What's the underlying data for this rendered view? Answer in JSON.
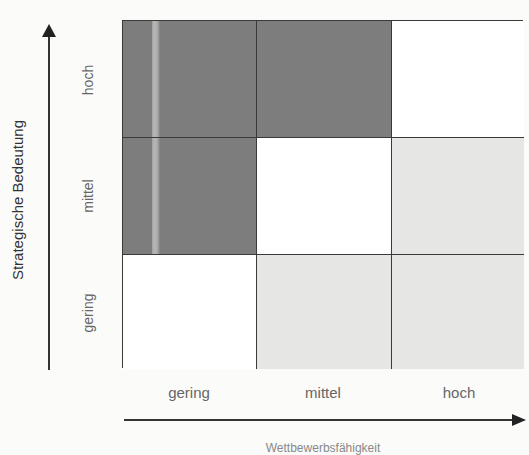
{
  "diagram": {
    "type": "portfolio-matrix-3x3",
    "y_axis": {
      "title": "Strategische Bedeutung",
      "ticks": [
        "hoch",
        "mittel",
        "gering"
      ]
    },
    "x_axis": {
      "title": "Wettbewerbsfähigkeit",
      "ticks": [
        "gering",
        "mittel",
        "hoch"
      ]
    },
    "cells": [
      {
        "row": "hoch",
        "col": "gering",
        "shade": "dark"
      },
      {
        "row": "hoch",
        "col": "mittel",
        "shade": "dark"
      },
      {
        "row": "hoch",
        "col": "hoch",
        "shade": "white"
      },
      {
        "row": "mittel",
        "col": "gering",
        "shade": "dark"
      },
      {
        "row": "mittel",
        "col": "mittel",
        "shade": "white"
      },
      {
        "row": "mittel",
        "col": "hoch",
        "shade": "light"
      },
      {
        "row": "gering",
        "col": "gering",
        "shade": "white"
      },
      {
        "row": "gering",
        "col": "mittel",
        "shade": "light"
      },
      {
        "row": "gering",
        "col": "hoch",
        "shade": "light"
      }
    ],
    "colors": {
      "dark": "#7d7d7d",
      "light": "#e6e6e5",
      "white": "#ffffff",
      "lines": "#3a3a3a"
    }
  }
}
